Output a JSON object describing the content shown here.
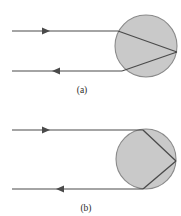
{
  "figure": {
    "kind": "optics-ray-diagram",
    "background_color": "#ffffff",
    "ink_color": "#4a4a4a",
    "sphere_fill": "#c9c9c9",
    "sphere_stroke": "#8a8a8a",
    "panels": [
      {
        "id": "a",
        "caption": "(a)",
        "caption_x": 82,
        "caption_y": 93,
        "sphere": {
          "cx": 146,
          "cy": 46,
          "r": 31
        },
        "incoming_ray": {
          "label": "incoming-ray",
          "x1": 12,
          "y1": 31,
          "x2": 118,
          "y2": 31,
          "arrow_x": 50,
          "arrow_dir": "right"
        },
        "outgoing_ray": {
          "label": "outgoing-ray",
          "x1": 12,
          "y1": 71,
          "x2": 122,
          "y2": 71,
          "arrow_x": 52,
          "arrow_dir": "left"
        },
        "internal_chords": [
          {
            "label": "chord-upper",
            "x1": 118,
            "y1": 31,
            "x2": 177,
            "y2": 52
          },
          {
            "label": "chord-lower",
            "x1": 177,
            "y1": 52,
            "x2": 122,
            "y2": 71
          }
        ]
      },
      {
        "id": "b",
        "caption": "(b)",
        "caption_x": 86,
        "caption_y": 211,
        "sphere": {
          "cx": 146,
          "cy": 159,
          "r": 30
        },
        "incoming_ray": {
          "label": "incoming-ray",
          "x1": 12,
          "y1": 130,
          "x2": 143,
          "y2": 130,
          "arrow_x": 50,
          "arrow_dir": "right"
        },
        "outgoing_ray": {
          "label": "outgoing-ray",
          "x1": 12,
          "y1": 189,
          "x2": 143,
          "y2": 189,
          "arrow_x": 56,
          "arrow_dir": "left"
        },
        "internal_chords": [
          {
            "label": "chord-upper",
            "x1": 143,
            "y1": 130,
            "x2": 176,
            "y2": 161
          },
          {
            "label": "chord-lower",
            "x1": 176,
            "y1": 161,
            "x2": 143,
            "y2": 189
          }
        ]
      }
    ]
  }
}
